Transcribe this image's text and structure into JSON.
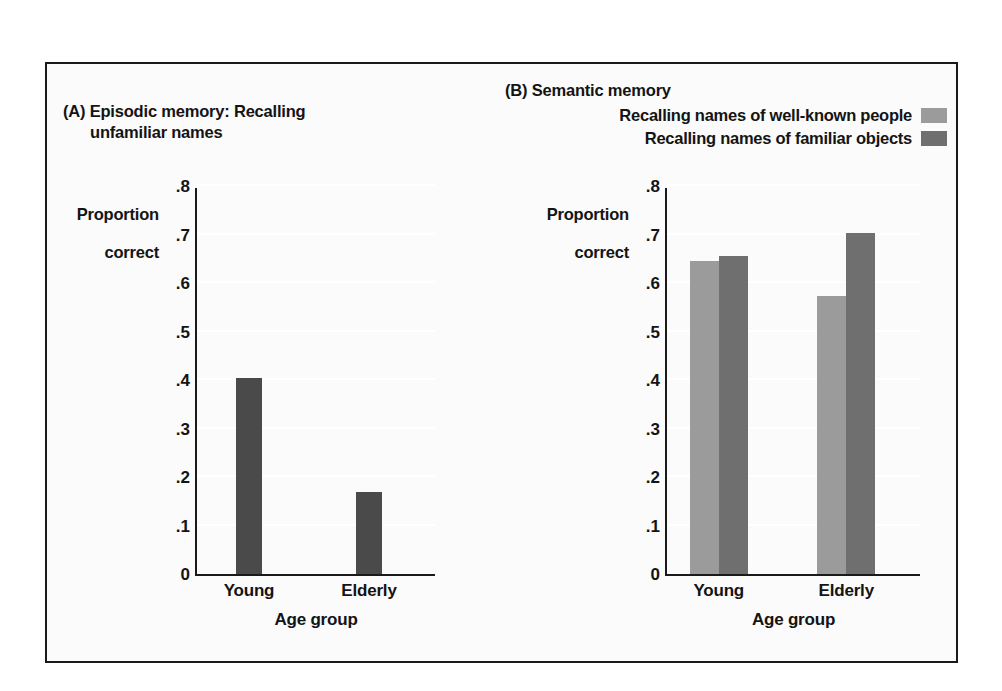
{
  "figure": {
    "background": "#fbfbfb",
    "border_color": "#1a1a1a"
  },
  "colors": {
    "dark_single": "#4a4a4a",
    "light_gray": "#9b9b9b",
    "dark_gray": "#6f6f6f",
    "gridline": "#ffffff",
    "axis": "#1a1a1a"
  },
  "panel_a": {
    "title_line1": "(A) Episodic memory: Recalling",
    "title_line2": "unfamiliar names",
    "ylabel_line1": "Proportion",
    "ylabel_line2": "correct",
    "xlabel": "Age group",
    "yticks": [
      ".8",
      ".7",
      ".6",
      ".5",
      ".4",
      ".3",
      ".2",
      ".1",
      "0"
    ]
  },
  "panel_b": {
    "title": "(B) Semantic memory",
    "ylabel_line1": "Proportion",
    "ylabel_line2": "correct",
    "xlabel": "Age group",
    "yticks": [
      ".8",
      ".7",
      ".6",
      ".5",
      ".4",
      ".3",
      ".2",
      ".1",
      "0"
    ],
    "legend": [
      {
        "label": "Recalling names of well-known people",
        "color": "#9b9b9b"
      },
      {
        "label": "Recalling names of familiar objects",
        "color": "#6f6f6f"
      }
    ]
  },
  "chart_data": [
    {
      "type": "bar",
      "panel": "A",
      "title": "(A) Episodic memory: Recalling unfamiliar names",
      "xlabel": "Age group",
      "ylabel": "Proportion correct",
      "categories": [
        "Young",
        "Elderly"
      ],
      "values": [
        0.405,
        0.17
      ],
      "series": [
        {
          "name": "Recalling unfamiliar names",
          "color": "#4a4a4a",
          "values": [
            0.405,
            0.17
          ]
        }
      ],
      "ylim": [
        0,
        0.8
      ],
      "ytick_values": [
        0,
        0.1,
        0.2,
        0.3,
        0.4,
        0.5,
        0.6,
        0.7,
        0.8
      ],
      "ytick_labels": [
        "0",
        ".1",
        ".2",
        ".3",
        ".4",
        ".5",
        ".6",
        ".7",
        ".8"
      ],
      "grid": true,
      "legend_position": "none"
    },
    {
      "type": "bar",
      "panel": "B",
      "title": "(B) Semantic memory",
      "xlabel": "Age group",
      "ylabel": "Proportion correct",
      "categories": [
        "Young",
        "Elderly"
      ],
      "series": [
        {
          "name": "Recalling names of well-known people",
          "color": "#9b9b9b",
          "values": [
            0.645,
            0.573
          ]
        },
        {
          "name": "Recalling names of familiar objects",
          "color": "#6f6f6f",
          "values": [
            0.655,
            0.703
          ]
        }
      ],
      "ylim": [
        0,
        0.8
      ],
      "ytick_values": [
        0,
        0.1,
        0.2,
        0.3,
        0.4,
        0.5,
        0.6,
        0.7,
        0.8
      ],
      "ytick_labels": [
        "0",
        ".1",
        ".2",
        ".3",
        ".4",
        ".5",
        ".6",
        ".7",
        ".8"
      ],
      "grid": true,
      "legend_position": "top-right"
    }
  ]
}
